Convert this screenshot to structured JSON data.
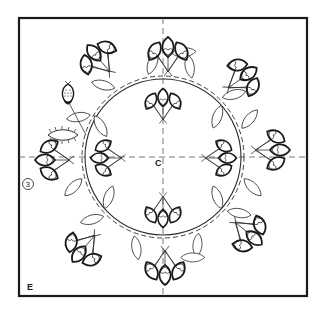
{
  "diagram": {
    "type": "quilting-appliqué-pattern",
    "frame": {
      "x": 19,
      "y": 18,
      "width": 288,
      "height": 278
    },
    "center": {
      "x": 163,
      "y": 157
    },
    "ring_radius": 78,
    "labels": {
      "center": "C",
      "corner": "E",
      "step_number": "3"
    },
    "colors": {
      "line": "#1a1a1a",
      "background": "#ffffff",
      "guide": "#555555"
    },
    "clusters": [
      {
        "name": "top",
        "x": 168,
        "y": 72,
        "angle": -90
      },
      {
        "name": "upper-right",
        "x": 228,
        "y": 88,
        "angle": -35
      },
      {
        "name": "right",
        "x": 255,
        "y": 150,
        "angle": 0
      },
      {
        "name": "lower-right",
        "x": 235,
        "y": 222,
        "angle": 40
      },
      {
        "name": "bottom",
        "x": 165,
        "y": 250,
        "angle": 90
      },
      {
        "name": "lower-left",
        "x": 95,
        "y": 235,
        "angle": 130
      },
      {
        "name": "left",
        "x": 70,
        "y": 160,
        "angle": 180
      },
      {
        "name": "upper-left",
        "x": 90,
        "y": 80,
        "angle": -130
      },
      {
        "name": "inner-top",
        "x": 163,
        "y": 120,
        "angle": -90
      },
      {
        "name": "inner-right",
        "x": 200,
        "y": 160,
        "angle": 0
      },
      {
        "name": "inner-bottom",
        "x": 163,
        "y": 195,
        "angle": 90
      },
      {
        "name": "inner-left",
        "x": 125,
        "y": 160,
        "angle": 180
      }
    ],
    "special_motifs": [
      {
        "name": "strawberry",
        "x": 68,
        "y": 95
      },
      {
        "name": "spiky-leaf",
        "x": 60,
        "y": 135
      }
    ]
  }
}
